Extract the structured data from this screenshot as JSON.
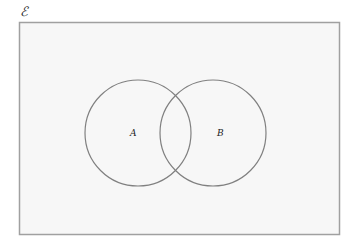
{
  "diagram": {
    "type": "venn",
    "universe_label": "ℰ",
    "sets": [
      {
        "label": "A"
      },
      {
        "label": "B"
      }
    ],
    "colors": {
      "background": "#ffffff",
      "universe_fill": "#f7f7f7",
      "universe_stroke": "#999999",
      "circle_stroke": "#808080",
      "text": "#222222"
    }
  }
}
